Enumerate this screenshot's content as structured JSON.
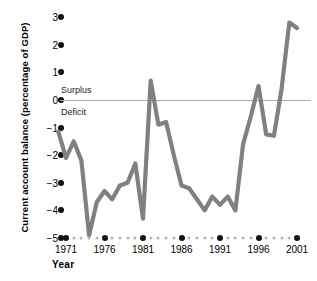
{
  "chart_data": {
    "type": "line",
    "title": "",
    "xlabel": "Year",
    "ylabel": "Current account balance (percentage of GDP)",
    "xlim": [
      1970,
      2001
    ],
    "ylim": [
      -5,
      3
    ],
    "grid": false,
    "legend": null,
    "zero_line": 0,
    "line_color": "#808080",
    "annotations": [
      {
        "text": "Surplus",
        "x": 1971,
        "y": 0.35
      },
      {
        "text": "Deficit",
        "x": 1971,
        "y": -0.45
      }
    ],
    "y_ticks": [
      3,
      2,
      1,
      0,
      -1,
      -2,
      -3,
      -4,
      -5
    ],
    "y_tick_labels": [
      "3",
      "2",
      "1",
      "0",
      "−1",
      "−2",
      "−3",
      "−4",
      "−5"
    ],
    "x_ticks": [
      1971,
      1976,
      1981,
      1986,
      1991,
      1996,
      2001
    ],
    "x_tick_labels": [
      "1971",
      "1976",
      "1981",
      "1986",
      "1991",
      "1996",
      "2001"
    ],
    "x": [
      1970,
      1971,
      1972,
      1973,
      1974,
      1975,
      1976,
      1977,
      1978,
      1979,
      1980,
      1981,
      1982,
      1983,
      1984,
      1985,
      1986,
      1987,
      1988,
      1989,
      1990,
      1991,
      1992,
      1993,
      1994,
      1995,
      1996,
      1997,
      1998,
      1999,
      2000,
      2001
    ],
    "y": [
      -1.15,
      -2.1,
      -1.5,
      -2.2,
      -4.9,
      -3.7,
      -3.3,
      -3.6,
      -3.1,
      -3.0,
      -2.3,
      -4.3,
      0.7,
      -0.9,
      -0.8,
      -2.0,
      -3.1,
      -3.2,
      -3.6,
      -4.0,
      -3.5,
      -3.8,
      -3.5,
      -4.0,
      -1.6,
      -0.6,
      0.5,
      -1.25,
      -1.3,
      0.4,
      2.8,
      2.6
    ],
    "series_name": "Current account balance"
  },
  "axes": {
    "y_title": "Current account balance (percentage of GDP)",
    "x_title": "Year"
  }
}
